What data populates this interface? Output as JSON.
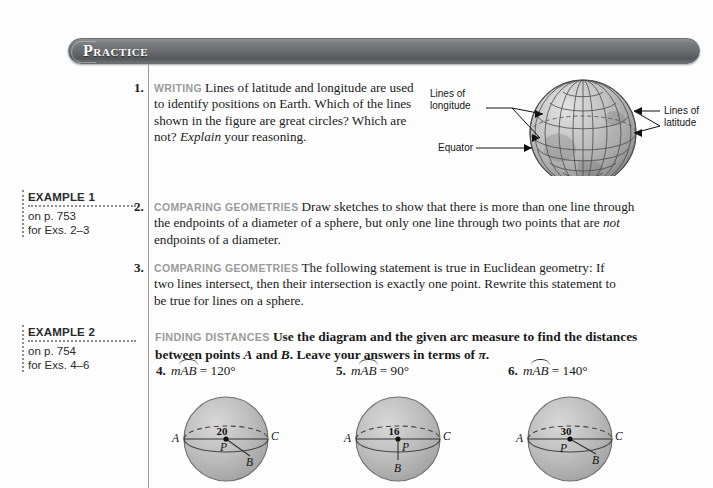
{
  "header": {
    "title": "Practice"
  },
  "sidebar": {
    "boxes": [
      {
        "title": "EXAMPLE 1",
        "page_line": "on p. 753",
        "exs_line": "for Exs. 2–3"
      },
      {
        "title": "EXAMPLE 2",
        "page_line": "on p. 754",
        "exs_line": "for Exs. 4–6"
      }
    ]
  },
  "exercises": [
    {
      "number": "1.",
      "tag": "WRITING",
      "text_1": "Lines of latitude and longitude are used to identify positions on Earth. Which of the lines shown in the figure are great circles? Which are not? ",
      "italic": "Explain",
      "text_2": " your reasoning."
    },
    {
      "number": "2.",
      "tag": "COMPARING GEOMETRIES",
      "text_1": "Draw sketches to show that there is more than one line through the endpoints of a diameter of a sphere, but only one line through two points that are ",
      "italic": "not",
      "text_2": " endpoints of a diameter."
    },
    {
      "number": "3.",
      "tag": "COMPARING GEOMETRIES",
      "text_1": "The following statement is true in Euclidean geometry: If two lines intersect, then their intersection is exactly one point. Rewrite this statement to be true for lines on a sphere.",
      "italic": "",
      "text_2": ""
    }
  ],
  "finding_distances": {
    "tag": "FINDING DISTANCES",
    "text_1": "Use the diagram and the given arc measure to find the distances between points ",
    "var_a": "A",
    "mid_1": " and ",
    "var_b": "B",
    "mid_2": ". Leave your answers in terms of ",
    "pi": "π",
    "end": "."
  },
  "problems": [
    {
      "number": "4.",
      "m": "m",
      "arc": "AB",
      "equals": "=",
      "value": "120°",
      "sphere": {
        "radius_label": "20",
        "center_label": "P",
        "point_a": "A",
        "point_b": "B",
        "point_c": "C",
        "b_position": "lower-right"
      }
    },
    {
      "number": "5.",
      "m": "m",
      "arc": "AB",
      "equals": "=",
      "value": "90°",
      "sphere": {
        "radius_label": "16",
        "center_label": "P",
        "point_a": "A",
        "point_b": "B",
        "point_c": "C",
        "b_position": "bottom"
      }
    },
    {
      "number": "6.",
      "m": "m",
      "arc": "AB",
      "equals": "=",
      "value": "140°",
      "sphere": {
        "radius_label": "30",
        "center_label": "P",
        "point_a": "A",
        "point_b": "B",
        "point_c": "C",
        "b_position": "lower-right"
      }
    }
  ],
  "globe": {
    "label_longitude_line1": "Lines of",
    "label_longitude_line2": "longitude",
    "label_latitude_line1": "Lines of",
    "label_latitude_line2": "latitude",
    "label_equator": "Equator"
  },
  "colors": {
    "header_bar": "#67696c",
    "tag_gray": "#9b9b9b",
    "rule_gray": "#9a9a9a",
    "sphere_fill": "#b4b4b4",
    "page_bg": "#fdfdfd"
  }
}
